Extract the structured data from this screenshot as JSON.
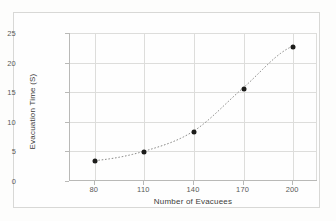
{
  "chart_data": {
    "type": "scatter",
    "title": "",
    "xlabel": "Number of Evacuees",
    "ylabel": "Evacuation Time (S)",
    "xlim": [
      65,
      215
    ],
    "ylim": [
      0,
      25
    ],
    "xticks": [
      "80",
      "110",
      "140",
      "170",
      "200"
    ],
    "yticks": [
      "0",
      "5",
      "10",
      "15",
      "20",
      "25"
    ],
    "grid": true,
    "legend": "none",
    "marker_color": "#1d1d1b",
    "trendline_color": "#7a7a78",
    "trendline_style": "dotted",
    "x": [
      80,
      110,
      140,
      170,
      200
    ],
    "values": [
      3.3,
      4.9,
      8.3,
      15.6,
      22.7
    ],
    "series": [
      {
        "name": "Evacuation Time",
        "points": [
          {
            "x": 80,
            "y": 3.3
          },
          {
            "x": 110,
            "y": 4.9
          },
          {
            "x": 140,
            "y": 8.3
          },
          {
            "x": 170,
            "y": 15.6
          },
          {
            "x": 200,
            "y": 22.7
          }
        ]
      }
    ]
  }
}
